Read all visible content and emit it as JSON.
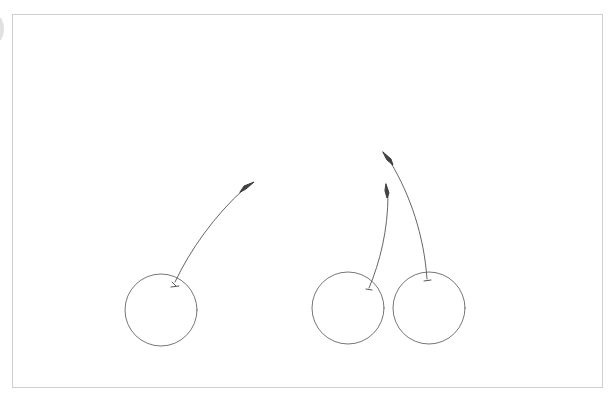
{
  "canvas": {
    "width": 615,
    "height": 397,
    "background": "#ffffff",
    "frame_border_color": "#cfcfcf",
    "stroke_color": "#555555"
  },
  "drawing": {
    "subject": "cherries-line-sketch",
    "cherries": [
      {
        "id": "cherry-1",
        "cx": 161,
        "cy": 310,
        "r": 36
      },
      {
        "id": "cherry-2",
        "cx": 348,
        "cy": 308,
        "r": 36
      },
      {
        "id": "cherry-3",
        "cx": 429,
        "cy": 308,
        "r": 36
      }
    ],
    "stems": [
      {
        "id": "stem-1",
        "base": [
          175,
          282
        ],
        "tip": [
          254,
          182
        ]
      },
      {
        "id": "stem-2",
        "base": [
          369,
          288
        ],
        "tip": [
          387,
          183
        ]
      },
      {
        "id": "stem-3",
        "base": [
          427,
          280
        ],
        "tip": [
          383,
          152
        ]
      }
    ]
  }
}
